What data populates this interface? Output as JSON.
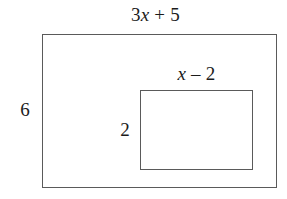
{
  "figure": {
    "type": "geometry-diagram",
    "background_color": "#ffffff",
    "stroke_color": "#5a5a5a",
    "text_color": "#1b1b1b",
    "shapes": {
      "outer_rectangle": {
        "name": "outer rectangle",
        "x": 42,
        "y": 34,
        "width": 235,
        "height": 154
      },
      "inner_rectangle": {
        "name": "inner rectangle",
        "x": 140,
        "y": 90,
        "width": 113,
        "height": 80
      }
    },
    "labels": {
      "outer_width": {
        "coefficient": "3",
        "variable": "x",
        "operator": "+",
        "constant": "5",
        "full_text": "3x + 5"
      },
      "outer_height": {
        "full_text": "6"
      },
      "inner_width": {
        "variable": "x",
        "operator": "–",
        "constant": "2",
        "full_text": "x – 2"
      },
      "inner_height": {
        "full_text": "2"
      }
    }
  }
}
